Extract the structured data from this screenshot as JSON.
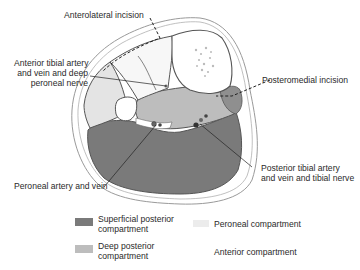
{
  "labels": {
    "anterolateral_incision": "Anterolateral incision",
    "anterior_tibial_line1": "Anterior tibial artery",
    "anterior_tibial_line2": "and vein and deep",
    "anterior_tibial_line3": "peroneal nerve",
    "posteromedial_incision": "Posteromedial incision",
    "posterior_tibial_line1": "Posterior tibial artery",
    "posterior_tibial_line2": "and vein and tibial nerve",
    "peroneal_artery": "Peroneal artery and vein"
  },
  "legend": [
    {
      "line1": "Superficial posterior",
      "line2": "compartment",
      "color": "#7a7a7a"
    },
    {
      "line1": "Deep posterior",
      "line2": "compartment",
      "color": "#bdbdbd"
    },
    {
      "line1": "Peroneal compartment",
      "line2": "",
      "color": "#ececec"
    },
    {
      "line1": "Anterior compartment",
      "line2": "",
      "color": "#ffffff"
    }
  ],
  "colors": {
    "superficial_posterior": "#7a7a7a",
    "deep_posterior": "#bdbdbd",
    "peroneal": "#e4e4e4",
    "anterior": "#f7f7f7",
    "outline": "#6a6a6a"
  }
}
